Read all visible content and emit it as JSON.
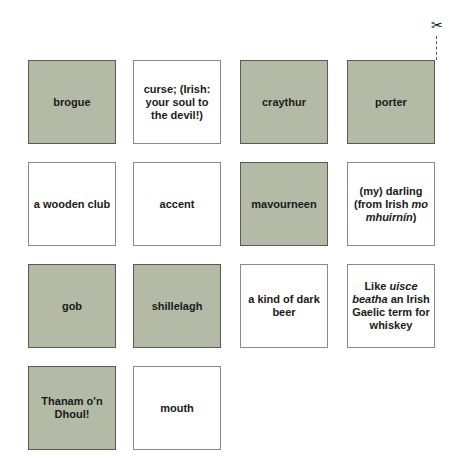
{
  "colors": {
    "term_fill": "#b3bba7",
    "term_border": "#5a5a55",
    "definition_fill": "#ffffff",
    "definition_border": "#8a8a8a"
  },
  "icons": {
    "scissors": "scissors-icon",
    "scissors_glyph": "✂"
  },
  "cards": [
    {
      "row": 1,
      "col": 1,
      "type": "term",
      "text": "brogue"
    },
    {
      "row": 1,
      "col": 2,
      "type": "definition",
      "text": "curse; (Irish: your soul to the devil!)"
    },
    {
      "row": 1,
      "col": 3,
      "type": "term",
      "text": "craythur"
    },
    {
      "row": 1,
      "col": 4,
      "type": "term",
      "text": "porter"
    },
    {
      "row": 2,
      "col": 1,
      "type": "definition",
      "text": "a wooden club"
    },
    {
      "row": 2,
      "col": 2,
      "type": "definition",
      "text": "accent"
    },
    {
      "row": 2,
      "col": 3,
      "type": "term",
      "text": "mavourneen"
    },
    {
      "row": 2,
      "col": 4,
      "type": "definition",
      "text": "(my) darling (from Irish mo mhuirnín)",
      "parts": [
        "(my) darling (from Irish ",
        "mo mhuirnín",
        ")"
      ]
    },
    {
      "row": 3,
      "col": 1,
      "type": "term",
      "text": "gob"
    },
    {
      "row": 3,
      "col": 2,
      "type": "term",
      "text": "shillelagh"
    },
    {
      "row": 3,
      "col": 3,
      "type": "definition",
      "text": "a kind of dark beer"
    },
    {
      "row": 3,
      "col": 4,
      "type": "definition",
      "text": "Like uisce beatha an Irish Gaelic term for whiskey",
      "parts": [
        "Like ",
        "uisce beatha",
        " an Irish Gaelic term for whiskey"
      ]
    },
    {
      "row": 4,
      "col": 1,
      "type": "term",
      "text": "Thanam o'n Dhoul!"
    },
    {
      "row": 4,
      "col": 2,
      "type": "definition",
      "text": "mouth"
    }
  ]
}
